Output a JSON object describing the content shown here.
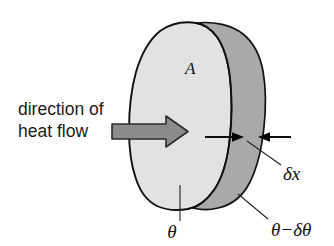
{
  "figure": {
    "background_color": "#ffffff",
    "labels": {
      "direction_line1": "direction of",
      "direction_line2": "heat flow",
      "area": "A",
      "thickness": "δx",
      "temperature_front": "θ",
      "temperature_back": "θ−δθ"
    },
    "colors": {
      "front_face": "#e2e2e2",
      "side_face": "#a9a9a9",
      "outline": "#111111",
      "flow_arrow_fill": "#8c8c8c",
      "flow_arrow_stroke": "#2b2b2b",
      "marker_arrow": "#000000",
      "text": "#1a1a1a"
    },
    "icons": {
      "flow_arrow": "right-arrow-icon",
      "thickness_arrow_left": "right-arrow-icon",
      "thickness_arrow_right": "left-arrow-icon"
    }
  }
}
